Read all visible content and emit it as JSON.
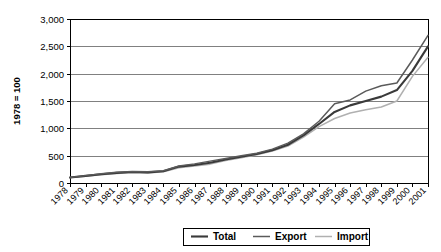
{
  "chart_data": {
    "type": "line",
    "title": "",
    "xlabel": "",
    "ylabel": "1978 = 100",
    "ylim": [
      0,
      3000
    ],
    "yticks": [
      "0",
      "500",
      "1,000",
      "1,500",
      "2,000",
      "2,500",
      "3,000"
    ],
    "ytick_values": [
      0,
      500,
      1000,
      1500,
      2000,
      2500,
      3000
    ],
    "grid": true,
    "legend_position": "bottom",
    "categories": [
      "1978",
      "1979",
      "1980",
      "1981",
      "1982",
      "1983",
      "1984",
      "1985",
      "1986",
      "1987",
      "1988",
      "1989",
      "1990",
      "1991",
      "1992",
      "1993",
      "1994",
      "1995",
      "1996",
      "1997",
      "1998",
      "1999",
      "2000",
      "2001"
    ],
    "series": [
      {
        "name": "Total",
        "color": "#3a3a3a",
        "width": 2.1,
        "values": [
          100,
          130,
          160,
          185,
          200,
          195,
          215,
          300,
          330,
          370,
          430,
          480,
          530,
          600,
          700,
          870,
          1080,
          1300,
          1420,
          1500,
          1580,
          1700,
          2050,
          2500
        ]
      },
      {
        "name": "Export",
        "color": "#5a5a5a",
        "width": 1.5,
        "values": [
          100,
          135,
          170,
          195,
          210,
          205,
          225,
          310,
          350,
          400,
          450,
          500,
          545,
          620,
          730,
          900,
          1130,
          1450,
          1520,
          1680,
          1780,
          1830,
          2250,
          2700
        ]
      },
      {
        "name": "Import",
        "color": "#b0b0b0",
        "width": 1.5,
        "values": [
          100,
          125,
          150,
          175,
          190,
          185,
          205,
          280,
          310,
          345,
          410,
          460,
          515,
          585,
          675,
          840,
          1030,
          1180,
          1280,
          1340,
          1390,
          1500,
          1950,
          2300
        ]
      }
    ]
  },
  "legend": {
    "items": [
      {
        "label": "Total"
      },
      {
        "label": "Export"
      },
      {
        "label": "Import"
      }
    ]
  }
}
